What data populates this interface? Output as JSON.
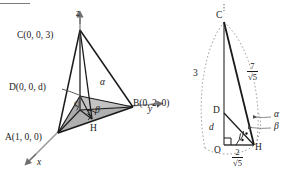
{
  "figure": {
    "caption_type": "geometry-diagram",
    "panels": [
      {
        "id": "left",
        "name": "tetrahedron-3d-view",
        "axes": {
          "z_label": "z",
          "y_label": "y",
          "x_label": "x"
        },
        "points": [
          {
            "key": "C",
            "label": "C(0, 0, 3)"
          },
          {
            "key": "D",
            "label": "D(0, 0, d)"
          },
          {
            "key": "A",
            "label": "A(1, 0, 0)"
          },
          {
            "key": "B",
            "label": "B(0, 2, 0)"
          },
          {
            "key": "H",
            "label": "H"
          },
          {
            "key": "O",
            "label": "O"
          }
        ],
        "angles": [
          {
            "key": "alpha",
            "label": "α"
          },
          {
            "key": "beta",
            "label": "β"
          }
        ]
      },
      {
        "id": "right",
        "name": "cross-section-view",
        "points": [
          {
            "key": "C",
            "label": "C"
          },
          {
            "key": "D",
            "label": "D"
          },
          {
            "key": "O",
            "label": "O"
          },
          {
            "key": "H",
            "label": "H"
          }
        ],
        "lengths": [
          {
            "key": "CO",
            "label": "3"
          },
          {
            "key": "DO",
            "label": "d"
          },
          {
            "key": "CH_num",
            "label": "7"
          },
          {
            "key": "CH_den",
            "label": "√5"
          },
          {
            "key": "OH_num",
            "label": "2"
          },
          {
            "key": "OH_den",
            "label": "√5"
          }
        ],
        "angles": [
          {
            "key": "alpha",
            "label": "α"
          },
          {
            "key": "beta",
            "label": "β"
          }
        ]
      }
    ],
    "colors": {
      "stroke": "#1a1a1a",
      "axis": "#8c8c8c",
      "shade": "#b3b3b3",
      "dotted": "#9a9a9a",
      "background": "#ffffff"
    }
  }
}
